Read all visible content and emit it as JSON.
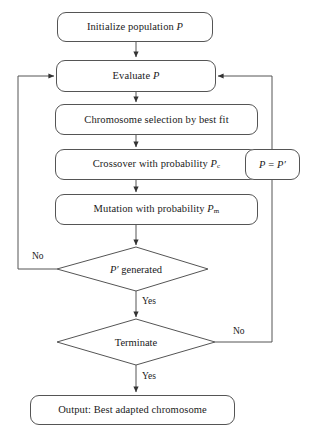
{
  "diagram": {
    "stroke_color": "#555555",
    "background": "#ffffff",
    "nodes": [
      {
        "id": "initialize",
        "shape": "rounded-rect",
        "text": "Initialize population P",
        "italic_tail": "P"
      },
      {
        "id": "evaluate",
        "shape": "rounded-rect",
        "text": "Evaluate P",
        "italic_tail": "P"
      },
      {
        "id": "selection",
        "shape": "rounded-rect",
        "text": "Chromosome selection by best fit"
      },
      {
        "id": "crossover",
        "shape": "rounded-rect",
        "text": "Crossover with probability Pc",
        "base": "Crossover with probability ",
        "symbol": "P",
        "subscript": "c"
      },
      {
        "id": "mutation",
        "shape": "rounded-rect",
        "text": "Mutation with probability Pm",
        "base": "Mutation with probability ",
        "symbol": "P",
        "subscript": "m"
      },
      {
        "id": "assign",
        "shape": "rounded-rect",
        "text": "P = P′"
      },
      {
        "id": "pgenerated",
        "shape": "diamond",
        "text": "P′ generated"
      },
      {
        "id": "terminate",
        "shape": "diamond",
        "text": "Terminate"
      },
      {
        "id": "output",
        "shape": "rounded-rect",
        "text": "Output: Best adapted chromosome"
      }
    ],
    "edge_labels": {
      "pgenerated_no": "No",
      "pgenerated_yes": "Yes",
      "terminate_no": "No",
      "terminate_yes": "Yes"
    },
    "text": {
      "initialize": "Initialize population ",
      "initialize_sym": "P",
      "evaluate": "Evaluate ",
      "evaluate_sym": "P",
      "selection": "Chromosome selection by best fit",
      "crossover_base": "Crossover with probability ",
      "crossover_sym": "P",
      "crossover_sub": "c",
      "mutation_base": "Mutation with probability ",
      "mutation_sym": "P",
      "mutation_sub": "m",
      "assign_left": "P",
      "assign_eq": " = ",
      "assign_right": "P′",
      "pgenerated_sym": "P′",
      "pgenerated_rest": " generated",
      "terminate": "Terminate",
      "output": "Output: Best adapted chromosome"
    }
  }
}
